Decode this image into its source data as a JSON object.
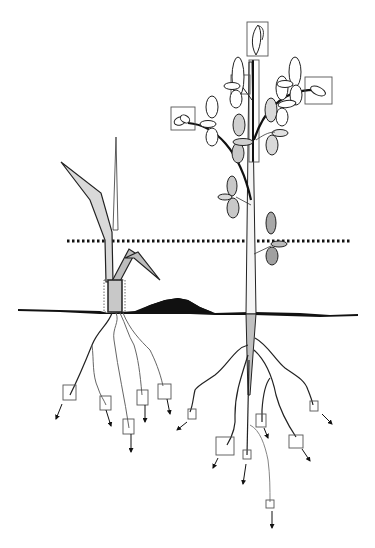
{
  "diagram": {
    "type": "plant-architecture-schematic",
    "colors": {
      "background": "#ffffff",
      "outline": "#1a1a1a",
      "leaf_light_fill": "#d9d9d9",
      "leaf_mid_fill": "#bdbdbd",
      "leaf_dark_fill": "#9e9e9e",
      "soil": "#111111",
      "box_stroke": "#555555"
    },
    "elements": {
      "reference_line": {
        "style": "dotted",
        "y": 241,
        "x_start": 67,
        "x_end": 350
      },
      "soil_surface": {
        "y": 311,
        "x_start": 18,
        "x_end": 358
      },
      "soil_mound": {
        "x_center": 180,
        "peak_y": 300
      },
      "left_plant": {
        "kind": "monocot",
        "root_meristem_boxes": 5,
        "shoot_base_box": 1
      },
      "right_plant": {
        "kind": "dicot",
        "shoot_meristem_boxes": 4,
        "root_meristem_boxes": 7,
        "stem_box": 1
      }
    }
  }
}
